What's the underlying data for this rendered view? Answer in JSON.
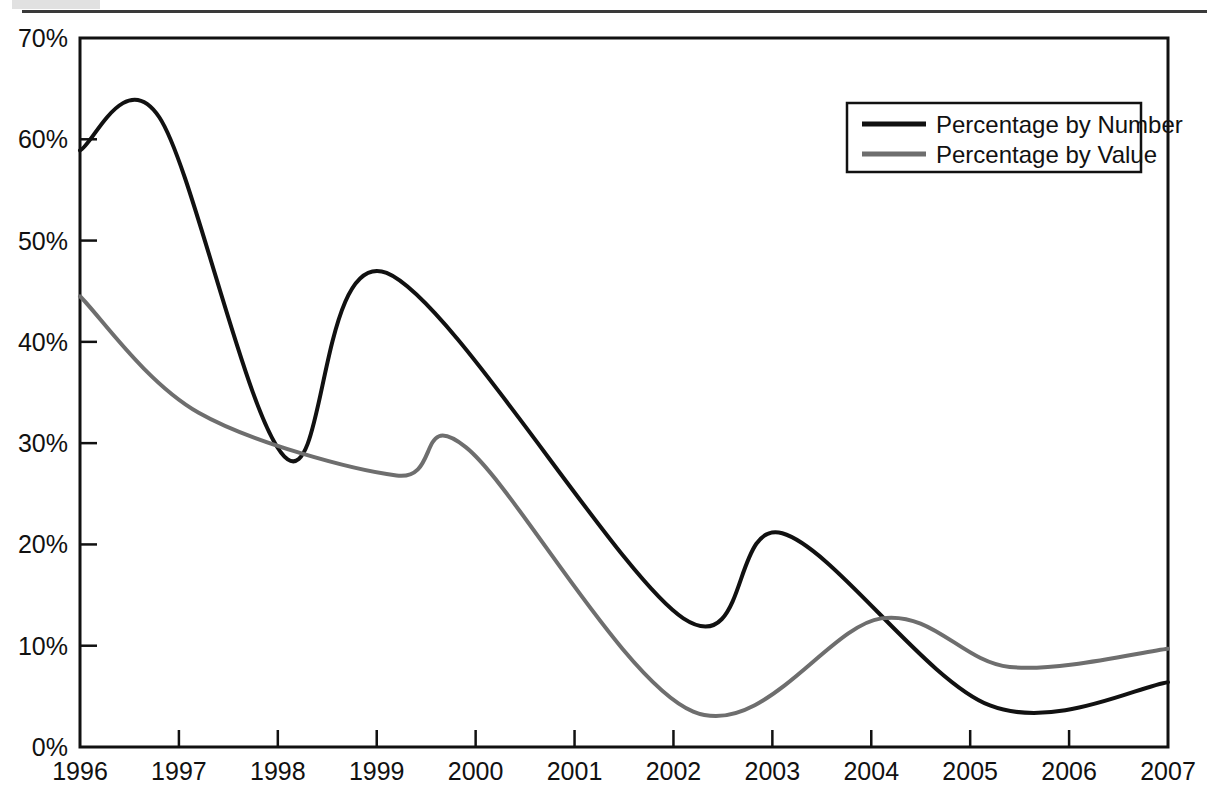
{
  "figure": {
    "background_color": "#ffffff",
    "has_top_rule": true,
    "scan_artifact": true
  },
  "chart_data": {
    "type": "line",
    "title": "",
    "subtitle": "",
    "xlabel": "",
    "ylabel": "",
    "xlim": [
      1996,
      2007
    ],
    "ylim": [
      0,
      70
    ],
    "grid": false,
    "legend_position": "top-right",
    "x_tick_labels": [
      "1996",
      "1997",
      "1998",
      "1999",
      "2000",
      "2001",
      "2002",
      "2003",
      "2004",
      "2005",
      "2006",
      "2007"
    ],
    "y_tick_labels": [
      "0%",
      "10%",
      "20%",
      "30%",
      "40%",
      "50%",
      "60%",
      "70%"
    ],
    "y_tick_values": [
      0,
      10,
      20,
      30,
      40,
      50,
      60,
      70
    ],
    "y_unit": "%",
    "x": [
      1996,
      1997,
      1998,
      1999,
      2000,
      2001,
      2002,
      2003,
      2004,
      2005,
      2006,
      2007
    ],
    "series": [
      {
        "name": "Percentage by Number",
        "color": "#111111",
        "line_width": 4,
        "values": [
          58.9,
          61.4,
          28.5,
          46.7,
          38.0,
          24.5,
          12.8,
          21.1,
          13.5,
          4.3,
          6.3,
          6.4
        ],
        "annotations": [
          {
            "x": 1996.0,
            "y": 58.9,
            "note": "start"
          },
          {
            "x": 1996.8,
            "y": 62.2,
            "note": "local max"
          },
          {
            "x": 1998.1,
            "y": 28.4,
            "note": "local min"
          },
          {
            "x": 1999.1,
            "y": 46.8,
            "note": "local max"
          },
          {
            "x": 2002.1,
            "y": 12.7,
            "note": "local min"
          },
          {
            "x": 2003.1,
            "y": 21.1,
            "note": "local max"
          },
          {
            "x": 2005.2,
            "y": 4.1,
            "note": "local min"
          },
          {
            "x": 2007.0,
            "y": 6.4,
            "note": "end"
          }
        ]
      },
      {
        "name": "Percentage by Value",
        "color": "#6e6e6e",
        "line_width": 4,
        "values": [
          44.5,
          33.2,
          32.1,
          27.0,
          29.4,
          13.2,
          3.7,
          7.2,
          12.7,
          8.0,
          8.6,
          9.7
        ],
        "annotations": [
          {
            "x": 1996.0,
            "y": 44.5,
            "note": "start"
          },
          {
            "x": 1997.2,
            "y": 33.0,
            "note": "shoulder"
          },
          {
            "x": 1999.2,
            "y": 26.8,
            "note": "local min"
          },
          {
            "x": 1999.9,
            "y": 29.6,
            "note": "local max"
          },
          {
            "x": 2002.2,
            "y": 3.5,
            "note": "local min"
          },
          {
            "x": 2004.1,
            "y": 12.7,
            "note": "local max"
          },
          {
            "x": 2005.4,
            "y": 7.9,
            "note": "local min"
          },
          {
            "x": 2007.0,
            "y": 9.7,
            "note": "end"
          }
        ]
      }
    ]
  },
  "legend": {
    "entries": [
      {
        "label": "Percentage by Number",
        "color": "#111111"
      },
      {
        "label": "Percentage by Value",
        "color": "#6e6e6e"
      }
    ]
  },
  "axes": {
    "y_ticks": [
      {
        "label": "70%",
        "value": 70
      },
      {
        "label": "60%",
        "value": 60
      },
      {
        "label": "50%",
        "value": 50
      },
      {
        "label": "40%",
        "value": 40
      },
      {
        "label": "30%",
        "value": 30
      },
      {
        "label": "20%",
        "value": 20
      },
      {
        "label": "10%",
        "value": 10
      },
      {
        "label": "0%",
        "value": 0
      }
    ],
    "x_ticks": [
      {
        "label": "1996",
        "value": 1996
      },
      {
        "label": "1997",
        "value": 1997
      },
      {
        "label": "1998",
        "value": 1998
      },
      {
        "label": "1999",
        "value": 1999
      },
      {
        "label": "2000",
        "value": 2000
      },
      {
        "label": "2001",
        "value": 2001
      },
      {
        "label": "2002",
        "value": 2002
      },
      {
        "label": "2003",
        "value": 2003
      },
      {
        "label": "2004",
        "value": 2004
      },
      {
        "label": "2005",
        "value": 2005
      },
      {
        "label": "2006",
        "value": 2006
      },
      {
        "label": "2007",
        "value": 2007
      }
    ]
  }
}
